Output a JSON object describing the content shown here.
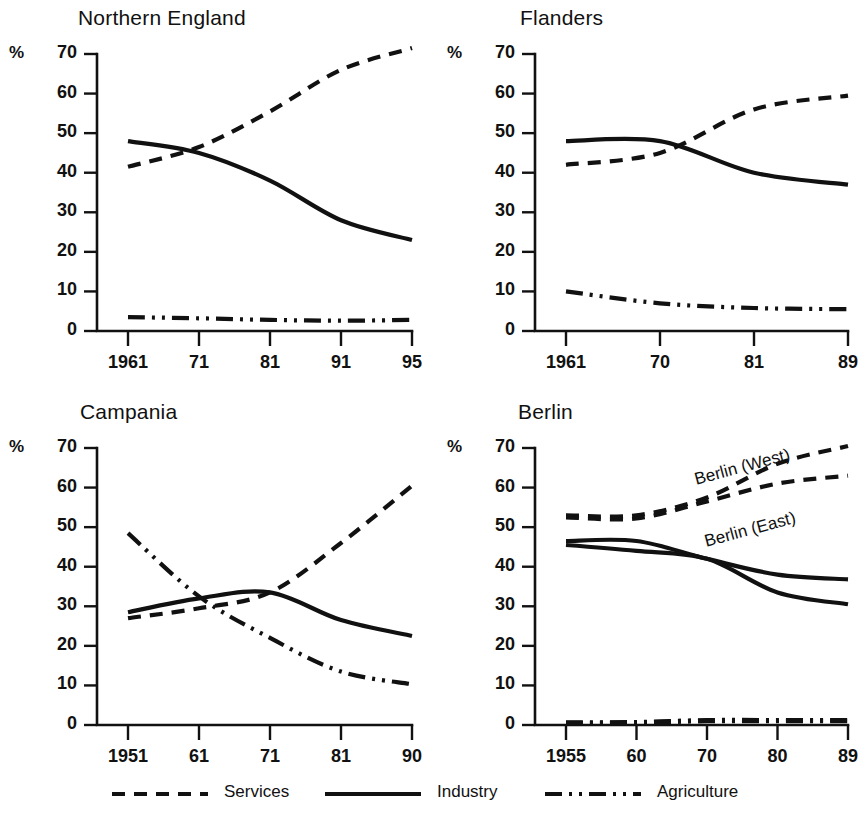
{
  "figure": {
    "width": 864,
    "height": 824,
    "background": "#ffffff",
    "ink_color": "#111111"
  },
  "legend": {
    "items": [
      {
        "label": "Services",
        "style": "dashed",
        "name": "legend-services"
      },
      {
        "label": "Industry",
        "style": "solid",
        "name": "legend-industry"
      },
      {
        "label": "Agriculture",
        "style": "dash-dot-dot",
        "name": "legend-agriculture"
      }
    ]
  },
  "axis_common": {
    "ylabel": "%",
    "yticks": [
      "0",
      "10",
      "20",
      "30",
      "40",
      "50",
      "60",
      "70"
    ],
    "ylim": [
      0,
      70
    ]
  },
  "chart_data": [
    {
      "type": "line",
      "title": "Northern England",
      "xlabel": "",
      "ylabel": "%",
      "ylim": [
        0,
        70
      ],
      "yticks": [
        0,
        10,
        20,
        30,
        40,
        50,
        60,
        70
      ],
      "grid": false,
      "legend_position": "below-figure",
      "categories": [
        "1961",
        "71",
        "81",
        "91",
        "95"
      ],
      "series": [
        {
          "name": "Services",
          "style": "dashed",
          "values": [
            41.5,
            46.5,
            55.5,
            66.0,
            71.5
          ]
        },
        {
          "name": "Industry",
          "style": "solid",
          "values": [
            48.0,
            45.0,
            38.0,
            28.0,
            23.0
          ]
        },
        {
          "name": "Agriculture",
          "style": "dash-dot-dot",
          "values": [
            3.5,
            3.2,
            2.8,
            2.6,
            2.8
          ]
        }
      ]
    },
    {
      "type": "line",
      "title": "Flanders",
      "xlabel": "",
      "ylabel": "%",
      "ylim": [
        0,
        70
      ],
      "yticks": [
        0,
        10,
        20,
        30,
        40,
        50,
        60,
        70
      ],
      "grid": false,
      "legend_position": "below-figure",
      "categories": [
        "1961",
        "70",
        "81",
        "89"
      ],
      "series": [
        {
          "name": "Services",
          "style": "dashed",
          "values": [
            42.0,
            45.0,
            56.0,
            59.5
          ]
        },
        {
          "name": "Industry",
          "style": "solid",
          "values": [
            48.0,
            48.0,
            40.0,
            37.0
          ]
        },
        {
          "name": "Agriculture",
          "style": "dash-dot-dot",
          "values": [
            10.0,
            7.0,
            5.8,
            5.5
          ]
        }
      ]
    },
    {
      "type": "line",
      "title": "Campania",
      "xlabel": "",
      "ylabel": "%",
      "ylim": [
        0,
        70
      ],
      "yticks": [
        0,
        10,
        20,
        30,
        40,
        50,
        60,
        70
      ],
      "grid": false,
      "legend_position": "below-figure",
      "categories": [
        "1951",
        "61",
        "71",
        "81",
        "90"
      ],
      "series": [
        {
          "name": "Services",
          "style": "dashed",
          "values": [
            27.0,
            29.5,
            33.5,
            46.0,
            60.5
          ]
        },
        {
          "name": "Industry",
          "style": "solid",
          "values": [
            28.5,
            32.0,
            33.5,
            26.5,
            22.5
          ]
        },
        {
          "name": "Agriculture",
          "style": "dash-dot-dot",
          "values": [
            48.5,
            32.5,
            22.0,
            13.5,
            10.3
          ]
        }
      ]
    },
    {
      "type": "line",
      "title": "Berlin",
      "xlabel": "",
      "ylabel": "%",
      "ylim": [
        0,
        70
      ],
      "yticks": [
        0,
        10,
        20,
        30,
        40,
        50,
        60,
        70
      ],
      "grid": false,
      "legend_position": "below-figure",
      "categories": [
        "1955",
        "60",
        "70",
        "80",
        "89"
      ],
      "annotations": [
        {
          "text": "Berlin (West)",
          "rotation_deg": -15
        },
        {
          "text": "Berlin (East)",
          "rotation_deg": -15
        }
      ],
      "series": [
        {
          "name": "Services (Berlin West)",
          "style": "dashed",
          "values": [
            53.0,
            53.0,
            57.5,
            66.0,
            70.5
          ]
        },
        {
          "name": "Services (Berlin East)",
          "style": "dashed",
          "values": [
            52.5,
            52.2,
            56.5,
            61.0,
            63.0
          ]
        },
        {
          "name": "Industry (Berlin West)",
          "style": "solid",
          "values": [
            46.5,
            46.5,
            42.0,
            38.0,
            36.8
          ]
        },
        {
          "name": "Industry (Berlin East)",
          "style": "solid",
          "values": [
            45.5,
            44.0,
            42.0,
            33.5,
            30.5
          ]
        },
        {
          "name": "Agriculture (Berlin West)",
          "style": "dash-dot-dot",
          "values": [
            0.6,
            0.7,
            1.2,
            1.2,
            1.2
          ]
        },
        {
          "name": "Agriculture (Berlin East)",
          "style": "dash-dot-dot",
          "values": [
            0.5,
            0.6,
            1.0,
            1.0,
            1.0
          ]
        }
      ]
    }
  ]
}
